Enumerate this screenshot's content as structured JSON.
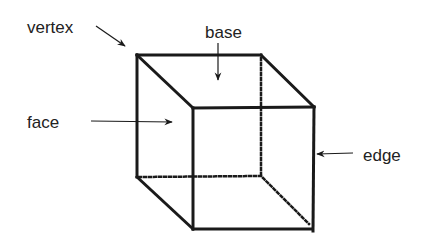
{
  "diagram": {
    "labels": {
      "vertex": "vertex",
      "base": "base",
      "face": "face",
      "edge": "edge"
    },
    "colors": {
      "stroke": "#1a1a1a",
      "text": "#222222",
      "background": "#ffffff"
    }
  }
}
